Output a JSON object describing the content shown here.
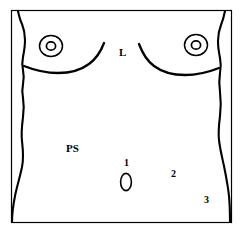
{
  "figure": {
    "name": "female-torso-anatomical-diagram",
    "background_color": "#ffffff",
    "line_color": "#000000",
    "frame": {
      "visible": true,
      "color": "#000000",
      "stroke_width": 1
    }
  },
  "labels": [
    {
      "id": "L",
      "text": "L",
      "meaning": "midline-sternum-marker",
      "x": 119,
      "y": 47
    },
    {
      "id": "PS",
      "text": "PS",
      "meaning": "left-abdomen-marker",
      "x": 66,
      "y": 143
    },
    {
      "id": "1",
      "text": "1",
      "meaning": "periumbilical-site-1",
      "x": 124,
      "y": 158
    },
    {
      "id": "2",
      "text": "2",
      "meaning": "lower-abdomen-site-2",
      "x": 171,
      "y": 169
    },
    {
      "id": "3",
      "text": "3",
      "meaning": "right-flank-site-3",
      "x": 204,
      "y": 195
    }
  ],
  "anatomy": {
    "parts": [
      {
        "name": "left-breast-outline",
        "type": "curve"
      },
      {
        "name": "right-breast-outline",
        "type": "curve"
      },
      {
        "name": "left-nipple-areola",
        "type": "concentric-circles"
      },
      {
        "name": "right-nipple-areola",
        "type": "concentric-circles"
      },
      {
        "name": "left-torso-contour",
        "type": "curve"
      },
      {
        "name": "right-torso-contour",
        "type": "curve"
      },
      {
        "name": "navel",
        "type": "ellipse"
      }
    ]
  }
}
